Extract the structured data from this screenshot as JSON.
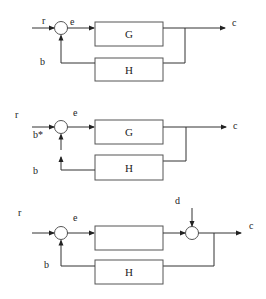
{
  "diagrams": [
    {
      "name": "standard-feedback-loop",
      "labels": {
        "input": "r",
        "error": "e",
        "feedback": "b",
        "output": "c"
      },
      "blocks": {
        "forward": "G",
        "feedback": "H"
      }
    },
    {
      "name": "broken-feedback-loop",
      "labels": {
        "input": "r",
        "error": "e",
        "substitute_feedback": "b*",
        "feedback": "b",
        "output": "c"
      },
      "blocks": {
        "forward": "G",
        "feedback": "H"
      }
    },
    {
      "name": "disturbance-feedback-loop",
      "labels": {
        "input": "r",
        "error": "e",
        "feedback": "b",
        "disturbance": "d",
        "output": "c"
      },
      "blocks": {
        "forward": "",
        "feedback": "H"
      }
    }
  ],
  "colors": {
    "line": "#333333",
    "box_border": "#555555",
    "background": "#ffffff"
  }
}
